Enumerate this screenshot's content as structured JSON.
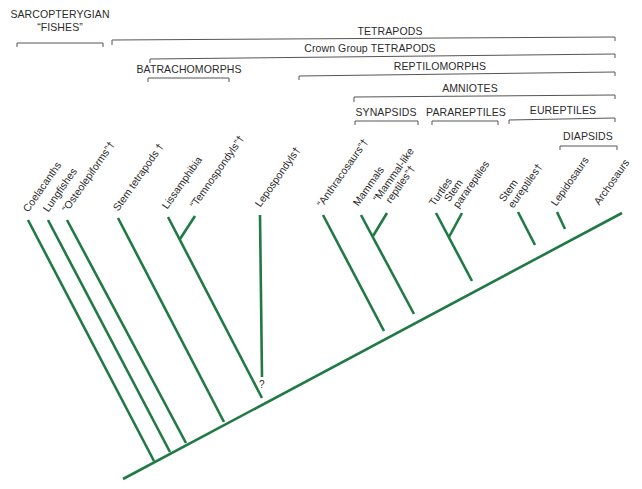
{
  "diagram": {
    "type": "cladogram",
    "branch_color": "#217a45",
    "bracket_color": "#555555",
    "text_color": "#2b2b2b",
    "groups": [
      {
        "id": "sarcopterygian",
        "label_line1": "SARCOPTERYGIAN",
        "label_line2": "“FISHES”"
      },
      {
        "id": "tetrapods",
        "label": "TETRAPODS"
      },
      {
        "id": "crown",
        "label": "Crown Group TETRAPODS"
      },
      {
        "id": "batrachomorphs",
        "label": "BATRACHOMORPHS"
      },
      {
        "id": "reptilomorphs",
        "label": "REPTILOMORPHS"
      },
      {
        "id": "amniotes",
        "label": "AMNIOTES"
      },
      {
        "id": "synapsids",
        "label": "SYNAPSIDS"
      },
      {
        "id": "parareptiles",
        "label": "PARAREPTILES"
      },
      {
        "id": "eureptiles",
        "label": "EUREPTILES"
      },
      {
        "id": "diapsids",
        "label": "DIAPSIDS"
      }
    ],
    "taxa": [
      {
        "id": "coelacanths",
        "label": "Coelacanths"
      },
      {
        "id": "lungfishes",
        "label": "Lungfishes"
      },
      {
        "id": "osteolepiforms",
        "label": "“Osteolepiforms”†"
      },
      {
        "id": "stem-tetrapods",
        "label": "Stem tetrapods †"
      },
      {
        "id": "lissamphibia",
        "label": "Lissamphibia"
      },
      {
        "id": "temnospondyls",
        "label": "“Temnospondyls”†"
      },
      {
        "id": "lepospondyls",
        "label": "Lepospondyls†"
      },
      {
        "id": "anthracosaurs",
        "label": "“Anthracosaurs”†"
      },
      {
        "id": "mammals",
        "label": "Mammals"
      },
      {
        "id": "mammal-like-reptiles",
        "label_line1": "“Mammal-like",
        "label_line2": "reptiles”†"
      },
      {
        "id": "turtles",
        "label": "Turtles"
      },
      {
        "id": "stem-parareptiles",
        "label_line1": "Stem",
        "label_line2": "parareptiles"
      },
      {
        "id": "stem-eureptiles",
        "label_line1": "Stem",
        "label_line2": "eureptiles†"
      },
      {
        "id": "lepidosaurs",
        "label": "Lepidosaurs"
      },
      {
        "id": "archosaurs",
        "label": "Archosaurs"
      }
    ],
    "uncertain_marker": "?"
  }
}
